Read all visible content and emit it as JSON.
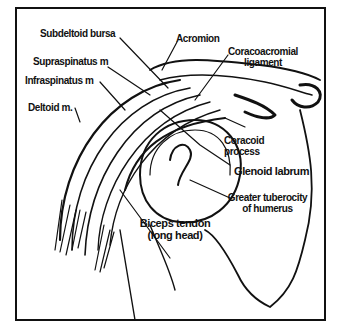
{
  "diagram": {
    "labels": {
      "subdeltoid_bursa": "Subdeltoid bursa",
      "supraspinatus": "Supraspinatus m",
      "infraspinatus": "Infraspinatus m",
      "deltoid": "Deltoid m.",
      "acromion": "Acromion",
      "coracoacromial_line1": "Coracoacromial",
      "coracoacromial_line2": "ligament",
      "coracoid_line1": "Coracoid",
      "coracoid_line2": "process",
      "glenoid_labrum": "Glenoid labrum",
      "greater_tuberosity_line1": "Greater tuberocity",
      "greater_tuberosity_line2": "of humerus",
      "biceps_line1": "Biceps tendon",
      "biceps_line2": "(long head)"
    },
    "colors": {
      "ink": "#111111",
      "background": "#ffffff"
    }
  }
}
